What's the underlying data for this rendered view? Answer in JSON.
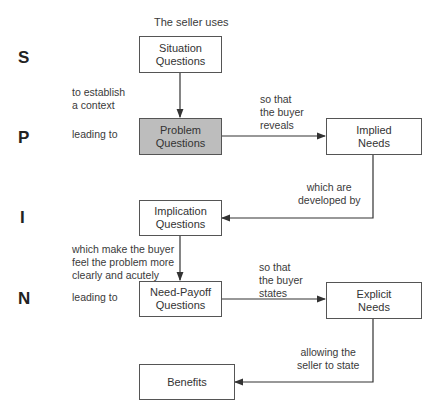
{
  "diagram": {
    "title": "The seller uses",
    "stages": [
      {
        "letter": "S"
      },
      {
        "letter": "P"
      },
      {
        "letter": "I"
      },
      {
        "letter": "N"
      }
    ],
    "boxes": {
      "situation": {
        "label": "Situation\nQuestions",
        "highlighted": false
      },
      "problem": {
        "label": "Problem\nQuestions",
        "highlighted": true
      },
      "implied_needs": {
        "label": "Implied\nNeeds",
        "highlighted": false
      },
      "implication": {
        "label": "Implication\nQuestions",
        "highlighted": false
      },
      "need_payoff": {
        "label": "Need-Payoff\nQuestions",
        "highlighted": false
      },
      "explicit_needs": {
        "label": "Explicit\nNeeds",
        "highlighted": false
      },
      "benefits": {
        "label": "Benefits",
        "highlighted": false
      }
    },
    "captions": {
      "establish_context": "to establish\na context",
      "leading_to_p": "leading to",
      "buyer_reveals": "so that\nthe buyer\nreveals",
      "developed_by": "which are\ndeveloped by",
      "feel_problem": "which make the buyer\nfeel the problem more\nclearly and acutely",
      "leading_to_n": "leading to",
      "buyer_states": "so that\nthe buyer\nstates",
      "seller_to_state": "allowing the\nseller to state"
    },
    "colors": {
      "highlight_fill": "#bdbdbd",
      "line": "#333333",
      "border": "#555555"
    }
  }
}
